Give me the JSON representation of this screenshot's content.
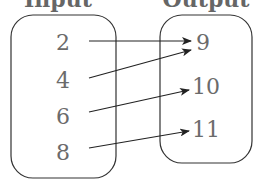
{
  "diagram": {
    "type": "mapping",
    "headers": {
      "input": "Input",
      "output": "Output"
    },
    "inputs": [
      "2",
      "4",
      "6",
      "8"
    ],
    "outputs": [
      "9",
      "10",
      "11"
    ],
    "mappings": [
      {
        "from": "2",
        "to": "9"
      },
      {
        "from": "4",
        "to": "9"
      },
      {
        "from": "6",
        "to": "10"
      },
      {
        "from": "8",
        "to": "11"
      }
    ]
  }
}
